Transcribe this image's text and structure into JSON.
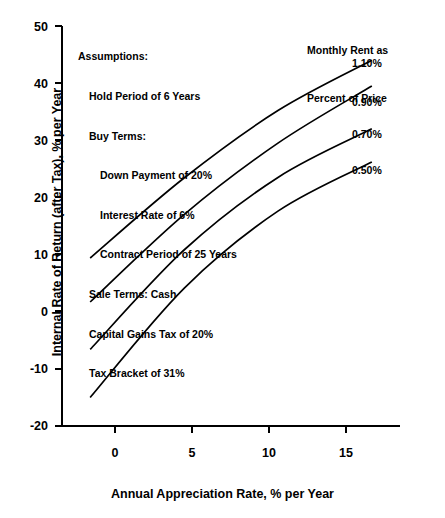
{
  "chart_data": {
    "type": "line",
    "title": "",
    "xlabel": "Annual Appreciation Rate, % per Year",
    "ylabel": "Internal Rate of Return (after Tax), % per Year",
    "x": [
      0,
      5,
      10,
      15
    ],
    "xlim": [
      -1.5,
      16.5
    ],
    "ylim": [
      -20,
      50
    ],
    "xticks": [
      "0",
      "5",
      "10",
      "15"
    ],
    "yticks": [
      "50",
      "40",
      "30",
      "20",
      "10",
      "0",
      "-10",
      "-20"
    ],
    "grid": false,
    "legend_position": "right-inline-labels",
    "legend_title_line1": "Monthly Rent as",
    "legend_title_line2": "Percent of Price",
    "series": [
      {
        "name": "1.10%",
        "label": "1.10%",
        "values": [
          9.4,
          23.4,
          35.2,
          44.0
        ]
      },
      {
        "name": "0.90%",
        "label": "0.90%",
        "values": [
          1.7,
          17.0,
          29.5,
          39.5
        ]
      },
      {
        "name": "0.70%",
        "label": "0.70%",
        "values": [
          -6.6,
          10.8,
          23.5,
          32.0
        ]
      },
      {
        "name": "0.50%",
        "label": "0.50%",
        "values": [
          -15.0,
          4.1,
          17.6,
          26.2
        ]
      }
    ],
    "annotations": {
      "assumptions_heading": "Assumptions:",
      "lines": [
        {
          "indent": 0,
          "text": "Hold Period of 6 Years"
        },
        {
          "indent": 0,
          "text": "Buy Terms:"
        },
        {
          "indent": 1,
          "text": "Down Payment of 20%"
        },
        {
          "indent": 1,
          "text": "Interest Rate of 6%"
        },
        {
          "indent": 1,
          "text": "Contract Period of 25 Years"
        },
        {
          "indent": 0,
          "text": "Sale Terms: Cash"
        },
        {
          "indent": 0,
          "text": "Capital Gains Tax of 20%"
        },
        {
          "indent": 0,
          "text": "Tax Bracket of 31%"
        }
      ]
    },
    "colors": {
      "line": "#000000",
      "axis": "#000000",
      "background": "#ffffff"
    }
  }
}
